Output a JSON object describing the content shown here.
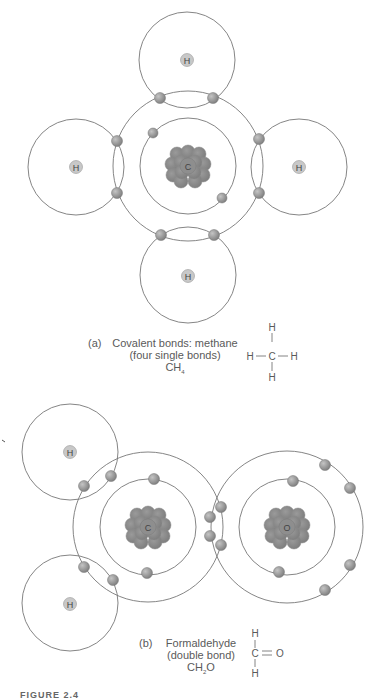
{
  "figure_label": "FIGURE 2.4",
  "colors": {
    "orbit_line": "#777777",
    "electron_fill": "#999999",
    "nucleus_fill": "#8a8a8a",
    "hydrogen_nucleus_fill": "#c8c8c8",
    "text": "#5a5a5a"
  },
  "panel_a": {
    "letter": "(a)",
    "title_line1": "Covalent bonds: methane",
    "title_line2": "(four single bonds)",
    "formula_base": "CH",
    "formula_sub": "4",
    "structural": {
      "top": "H",
      "left": "H",
      "center": "C",
      "right": "H",
      "bottom": "H",
      "bond_h": "—",
      "bond_v": "|"
    },
    "central_atom": "C",
    "hydrogens": [
      "H",
      "H",
      "H",
      "H"
    ]
  },
  "panel_b": {
    "letter": "(b)",
    "title_line1": "Formaldehyde",
    "title_line2": "(double bond)",
    "formula_base": "CH",
    "formula_sub": "2",
    "formula_tail": "O",
    "structural": {
      "top": "H",
      "center": "C",
      "double_bond": "=",
      "right": "O",
      "bottom": "H",
      "bond_v": "|"
    },
    "atoms": [
      "C",
      "O"
    ],
    "hydrogens": [
      "H",
      "H"
    ]
  }
}
